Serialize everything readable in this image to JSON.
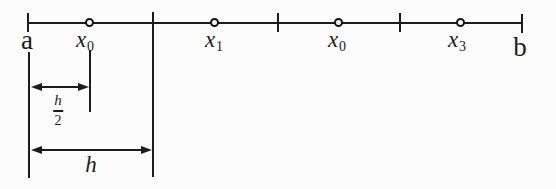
{
  "figure": {
    "endpoints": {
      "left": "a",
      "right": "b"
    },
    "points": [
      {
        "base": "x",
        "sub": "0"
      },
      {
        "base": "x",
        "sub": "1"
      },
      {
        "base": "x",
        "sub": "0"
      },
      {
        "base": "x",
        "sub": "3"
      }
    ],
    "dimensions": {
      "half_width": {
        "numerator": "h",
        "denominator": "2"
      },
      "full_width": "h"
    },
    "colors": {
      "ink": "#1b1b1b",
      "background": "#fcfcfc"
    }
  }
}
